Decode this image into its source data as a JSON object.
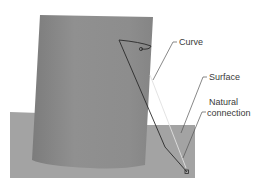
{
  "labels": {
    "curve": "Curve",
    "surface": "Surface",
    "natural_connection_line1": "Natural",
    "natural_connection_line2": "connection"
  },
  "colors": {
    "background": "#ffffff",
    "cylinder": "#8f8f8f",
    "cylinder_shadow": "#7a7a7a",
    "plane": "#a3a3a3",
    "curve_line": "#2a2a2a",
    "leader_line": "#555555",
    "text": "#3a3a3a"
  }
}
